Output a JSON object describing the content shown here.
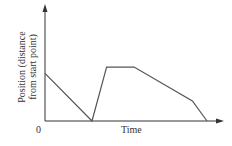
{
  "chart_data": {
    "type": "line",
    "title": "",
    "xlabel": "Time",
    "ylabel_line1": "Position (distance",
    "ylabel_line2": "from start point)",
    "origin_label": "0",
    "grid": false,
    "legend": null,
    "series": [
      {
        "name": "position",
        "color": "#555555",
        "points": [
          {
            "x": 0,
            "y": 0.62
          },
          {
            "x": 0.29,
            "y": 0
          },
          {
            "x": 0.38,
            "y": 0.7
          },
          {
            "x": 0.55,
            "y": 0.7
          },
          {
            "x": 0.91,
            "y": 0.26
          },
          {
            "x": 1.0,
            "y": 0
          }
        ]
      }
    ],
    "xlim": [
      0,
      1.1
    ],
    "ylim": [
      0,
      1.1
    ]
  },
  "colors": {
    "axis": "#333333",
    "line": "#555555"
  }
}
